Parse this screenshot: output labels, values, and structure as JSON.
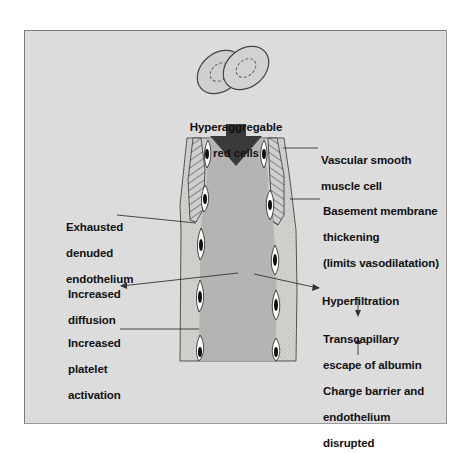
{
  "diagram": {
    "title_top": {
      "lines": [
        "Hyperaggregable",
        "red cells"
      ]
    },
    "labels_right": [
      {
        "id": "vascular-smooth-muscle",
        "lines": [
          "Vascular smooth",
          "muscle cell"
        ]
      },
      {
        "id": "basement-membrane",
        "lines": [
          "Basement membrane",
          "thickening",
          "(limits vasodilatation)"
        ]
      },
      {
        "id": "hyperfiltration",
        "lines": [
          "Hyperfiltration"
        ]
      },
      {
        "id": "transcapillary",
        "lines": [
          "Transcapillary",
          "escape of albumin"
        ]
      },
      {
        "id": "charge-barrier",
        "lines": [
          "Charge barrier and",
          "endothelium",
          "disrupted"
        ]
      }
    ],
    "labels_left": [
      {
        "id": "exhausted-endothelium",
        "lines": [
          "Exhausted",
          "denuded",
          "endothelium"
        ]
      },
      {
        "id": "increased-diffusion",
        "lines": [
          "Increased",
          "diffusion"
        ]
      },
      {
        "id": "increased-platelet",
        "lines": [
          "Increased",
          "platelet",
          "activation"
        ]
      }
    ],
    "colors": {
      "background": "#dcdcdc",
      "lumen": "#b4b4b4",
      "adventitia": "#d2d0cb",
      "arrow": "#3a3a3a",
      "text": "#111111"
    }
  }
}
